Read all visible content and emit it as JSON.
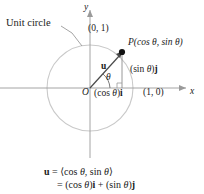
{
  "figure": {
    "background_color": "#ffffff",
    "axis_color": "#9a9a9a",
    "circle_color": "#c9c9c9",
    "vector_color": "#555555",
    "text_color": "#1a1a1a"
  },
  "annotations": {
    "unit_circle_label": "Unit circle",
    "y_axis_label": "y",
    "x_axis_label": "x",
    "point_top": "(0, 1)",
    "point_right": "(1, 0)",
    "point_p": "P(cos θ, sin θ)",
    "vector_u": "u",
    "angle_theta": "θ",
    "origin": "O",
    "component_x_open": "(cos ",
    "component_x_theta": "θ",
    "component_x_close": ")",
    "component_x_unit": "i",
    "component_y_open": "(sin ",
    "component_y_theta": "θ",
    "component_y_close": ")",
    "component_y_unit": "j"
  },
  "equations": {
    "line1": {
      "lhs": "u",
      "eq": "=",
      "rhs_open": "⟨cos ",
      "rhs_theta1": "θ",
      "rhs_mid": ", sin ",
      "rhs_theta2": "θ",
      "rhs_close": "⟩"
    },
    "line2": {
      "eq": "=",
      "t1_open": "(cos ",
      "t1_theta": "θ",
      "t1_close": ")",
      "t1_unit": "i",
      "plus": "+",
      "t2_open": "(sin ",
      "t2_theta": "θ",
      "t2_close": ")",
      "t2_unit": "j"
    }
  },
  "geometry": {
    "center_x": 90,
    "center_y": 88,
    "radius": 43,
    "point_p_x": 122,
    "point_p_y": 52,
    "angle_degrees": 48
  }
}
